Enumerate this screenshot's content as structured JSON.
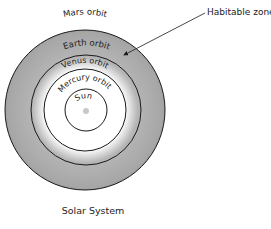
{
  "diagram": {
    "title": "Solar System",
    "callout": {
      "label": "Habitable zone"
    },
    "center": "Sun",
    "orbits": [
      {
        "name": "Mercury",
        "label": "Mercury orbit",
        "radius": 21
      },
      {
        "name": "Venus",
        "label": "Venus orbit",
        "radius": 41
      },
      {
        "name": "Earth",
        "label": "Earth orbit",
        "radius": 55
      },
      {
        "name": "Mars",
        "label": "Mars orbit",
        "radius": 80
      }
    ],
    "colors": {
      "habitable_zone": "#a9a9a9",
      "orbit_line": "#1a1a1a",
      "sun": "#c8c8c8",
      "background": "#ffffff"
    }
  }
}
